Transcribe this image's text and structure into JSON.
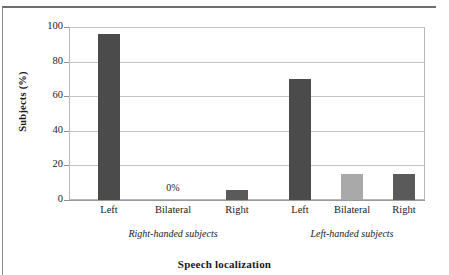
{
  "chart_data": {
    "type": "bar",
    "title": "",
    "xlabel": "Speech localization",
    "ylabel": "Subjects (%)",
    "ylim": [
      0,
      100
    ],
    "yticks": [
      0,
      20,
      40,
      60,
      80,
      100
    ],
    "grid": true,
    "legend": "none",
    "groups": [
      {
        "name": "Right-handed subjects",
        "categories": [
          "Left",
          "Bilateral",
          "Right"
        ],
        "values": [
          96,
          0,
          6
        ],
        "colors": [
          "#4b4b4b",
          "#4b4b4b",
          "#5a5a5a"
        ],
        "data_labels": [
          "",
          "0%",
          ""
        ]
      },
      {
        "name": "Left-handed subjects",
        "categories": [
          "Left",
          "Bilateral",
          "Right"
        ],
        "values": [
          70,
          15,
          15
        ],
        "colors": [
          "#4b4b4b",
          "#a9a9a9",
          "#5a5a5a"
        ],
        "data_labels": [
          "",
          "",
          ""
        ]
      }
    ],
    "annotations": [
      {
        "text": "0%",
        "group": 0,
        "category": "Bilateral"
      }
    ]
  },
  "axis": {
    "y_title": "Subjects (%)",
    "x_title": "Speech localization",
    "y_tick_labels": [
      "100",
      "80",
      "60",
      "40",
      "20",
      "0"
    ]
  },
  "colors": {
    "bar_dark": "#4b4b4b",
    "bar_mid": "#5a5a5a",
    "bar_light": "#a9a9a9",
    "gridline": "#c3c3c3",
    "axis": "#9a9a9a",
    "frame": "#8a8a8a",
    "text": "#1a1a1a"
  }
}
